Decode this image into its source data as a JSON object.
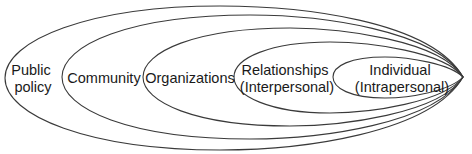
{
  "diagram": {
    "type": "nested-ellipses",
    "title": "",
    "stroke_color": "#3a3a3a",
    "levels": [
      {
        "name": "public-policy",
        "lines": [
          "Public",
          "policy"
        ]
      },
      {
        "name": "community",
        "lines": [
          "Community"
        ]
      },
      {
        "name": "organizations",
        "lines": [
          "Organizations"
        ]
      },
      {
        "name": "relationships",
        "lines": [
          "Relationships",
          "(Interpersonal)"
        ]
      },
      {
        "name": "individual",
        "lines": [
          "Individual",
          "(Intrapersonal)"
        ]
      }
    ]
  }
}
